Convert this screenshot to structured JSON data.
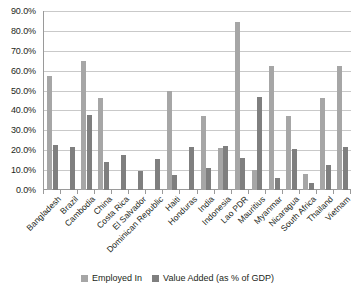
{
  "chart_data": {
    "type": "bar",
    "title": "",
    "xlabel": "",
    "ylabel": "",
    "ylim": [
      0,
      90
    ],
    "ytick_labels": [
      "0.0%",
      "10.0%",
      "20.0%",
      "30.0%",
      "40.0%",
      "50.0%",
      "60.0%",
      "70.0%",
      "80.0%",
      "90.0%"
    ],
    "ytick_values": [
      0,
      10,
      20,
      30,
      40,
      50,
      60,
      70,
      80,
      90
    ],
    "grid": true,
    "legend_position": "bottom",
    "categories": [
      "Bangladesh",
      "Brazil",
      "Cambodia",
      "China",
      "Costa Rica",
      "El Salvador",
      "Dominican Republic",
      "Haiti",
      "Honduras",
      "India",
      "Indonesia",
      "Lao PDR",
      "Mauritius",
      "Myanmar",
      "Nicaragua",
      "South Africa",
      "Thailand",
      "Vietnam"
    ],
    "series": [
      {
        "name": "Employed In",
        "color": "#a6a6a6",
        "values": [
          57.5,
          0.0,
          65.0,
          46.5,
          0.0,
          0.0,
          0.0,
          50.0,
          0.0,
          37.0,
          21.0,
          84.5,
          10.0,
          62.5,
          37.0,
          8.0,
          46.5,
          62.5
        ]
      },
      {
        "name": "Value Added (as % of GDP)",
        "color": "#7f7f7f",
        "values": [
          22.5,
          21.5,
          37.8,
          14.0,
          17.5,
          9.8,
          15.5,
          7.3,
          21.5,
          11.3,
          22.0,
          16.0,
          47.0,
          6.0,
          20.5,
          3.5,
          12.5,
          21.5
        ]
      }
    ]
  },
  "legend": {
    "items": [
      {
        "label": "Employed In"
      },
      {
        "label": "Value Added (as % of GDP)"
      }
    ]
  }
}
